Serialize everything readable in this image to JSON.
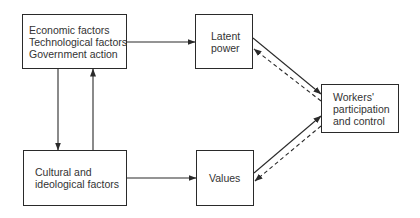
{
  "diagram": {
    "nodes": {
      "drivers": {
        "lines": [
          "Economic factors",
          "Technological factors",
          "Government action"
        ]
      },
      "latent_power": {
        "lines": [
          "Latent",
          "power"
        ]
      },
      "cultural": {
        "lines": [
          "Cultural and",
          "ideological factors"
        ]
      },
      "values": {
        "lines": [
          "Values"
        ]
      },
      "workers": {
        "lines": [
          "Workers'",
          "participation",
          "and control"
        ]
      }
    },
    "edges": [
      {
        "from": "drivers",
        "to": "latent_power",
        "style": "solid"
      },
      {
        "from": "drivers",
        "to": "cultural",
        "style": "solid"
      },
      {
        "from": "cultural",
        "to": "drivers",
        "style": "solid"
      },
      {
        "from": "cultural",
        "to": "values",
        "style": "solid"
      },
      {
        "from": "latent_power",
        "to": "workers",
        "style": "solid"
      },
      {
        "from": "workers",
        "to": "latent_power",
        "style": "dashed"
      },
      {
        "from": "values",
        "to": "workers",
        "style": "solid"
      },
      {
        "from": "workers",
        "to": "values",
        "style": "dashed"
      }
    ],
    "colors": {
      "stroke": "#2a2a2a",
      "text": "#333333",
      "background": "#ffffff"
    }
  }
}
